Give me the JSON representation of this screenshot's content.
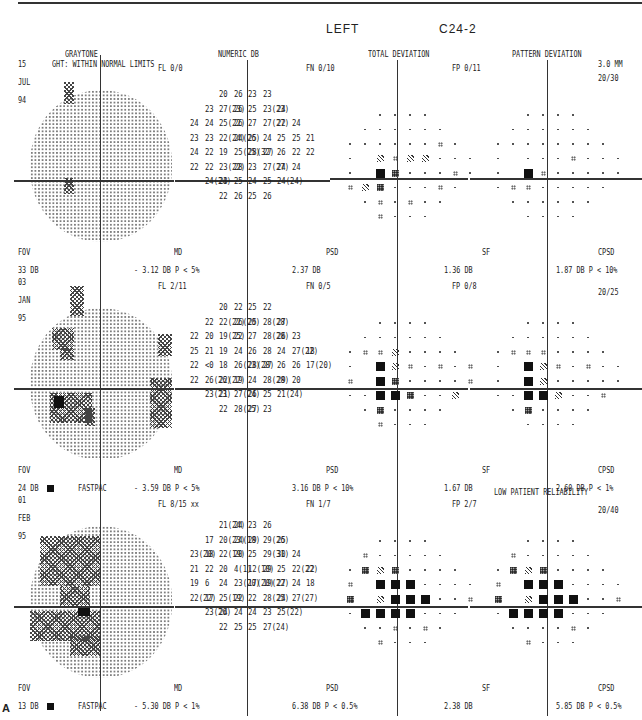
{
  "header": {
    "eye": "LEFT",
    "program": "C24-2"
  },
  "columns": [
    "GRAYTONE",
    "NUMERIC DB",
    "TOTAL DEVIATION",
    "PATTERN DEVIATION"
  ],
  "figure_label": "A",
  "tests": [
    {
      "date": [
        "15",
        "JUL",
        "94"
      ],
      "ght": "GHT: WITHIN NORMAL LIMITS",
      "fl": "FL 0/0",
      "fn": "FN 0/10",
      "fp": "FP 0/11",
      "pupil": "3.0 MM",
      "acuity": "20/30",
      "reliability_note": "",
      "fov_label": "FOV",
      "fov_value": "33 DB",
      "strategy": "",
      "md_label": "MD",
      "md_value": "- 3.12 DB  P <  5%",
      "psd_label": "PSD",
      "psd_value": "2.37 DB",
      "sf_label": "SF",
      "sf_value": "1.36 DB",
      "cpsd_label": "CPSD",
      "cpsd_value": "1.87 DB  P < 10%",
      "numeric_rows": [
        [
          "20",
          "26",
          "|",
          "23",
          "23"
        ],
        [
          "23",
          "27(23)",
          "26",
          "|",
          "25",
          "23(23)",
          "24"
        ],
        [
          "24",
          "24",
          "25(22)",
          "26",
          "|",
          "27",
          "27(27)",
          "22",
          "24"
        ],
        [
          "23",
          "23",
          "22(24)",
          "24(26)",
          "|",
          "25",
          "24",
          "25",
          "25",
          "21"
        ],
        [
          "24",
          "22",
          "19",
          "25(25)",
          "|",
          "28(32)",
          "27",
          "26",
          "22",
          "22"
        ],
        [
          "22",
          "22",
          "23(22)",
          "28",
          "|",
          "23",
          "27(27)",
          "24",
          "24"
        ],
        [
          "24(24)",
          "23",
          "25",
          "|",
          "24",
          "25",
          "24(24)"
        ],
        [
          "22",
          "26",
          "|",
          "25",
          "26"
        ]
      ]
    },
    {
      "date": [
        "03",
        "JAN",
        "95"
      ],
      "ght": "",
      "fl": "FL 2/11",
      "fn": "FN 0/5",
      "fp": "FP 0/8",
      "pupil": "",
      "acuity": "20/25",
      "reliability_note": "",
      "fov_label": "FOV",
      "fov_value": "24 DB",
      "strategy": "FASTPAC",
      "md_label": "MD",
      "md_value": "- 3.59 DB  P <  5%",
      "psd_label": "PSD",
      "psd_value": "3.16 DB  P < 10%",
      "sf_label": "SF",
      "sf_value": "1.67 DB",
      "cpsd_label": "CPSD",
      "cpsd_value": "2.60 DB  P <  1%",
      "numeric_rows": [
        [
          "20",
          "22",
          "|",
          "25",
          "22"
        ],
        [
          "22",
          "22(22)",
          "26(20)",
          "|",
          "25",
          "28(28)",
          "27"
        ],
        [
          "22",
          "20",
          "19(25)",
          "22",
          "|",
          "27",
          "28(28)",
          "26",
          "23"
        ],
        [
          "25",
          "21",
          "19",
          "24",
          "|",
          "26",
          "28",
          "24",
          "27(22)",
          "18"
        ],
        [
          "22",
          "<0",
          "18",
          "26(23)",
          "|",
          "28(28)",
          "27",
          "26",
          "26",
          "17(20)"
        ],
        [
          "22",
          "26(26)",
          "22(22)",
          "19",
          "|",
          "24",
          "28(28)",
          "29",
          "20"
        ],
        [
          "23(23)",
          "21",
          "27(24)",
          "|",
          "26",
          "25",
          "21(24)"
        ],
        [
          "22",
          "28(25)",
          "|",
          "27",
          "23"
        ]
      ]
    },
    {
      "date": [
        "01",
        "FEB",
        "95"
      ],
      "ght": "",
      "fl": "FL 8/15 xx",
      "fn": "FN 1/7",
      "fp": "FP 2/7",
      "pupil": "",
      "acuity": "20/40",
      "reliability_note": "LOW PATIENT RELIABILITY",
      "fov_label": "FOV",
      "fov_value": "13 DB",
      "strategy": "FASTPAC",
      "md_label": "MD",
      "md_value": "- 5.30 DB  P <  1%",
      "psd_label": "PSD",
      "psd_value": "6.38 DB  P < 0.5%",
      "sf_label": "SF",
      "sf_value": "2.38 DB",
      "cpsd_label": "CPSD",
      "cpsd_value": "5.85 DB  P < 0.5%",
      "numeric_rows": [
        [
          "21(24)",
          "24",
          "|",
          "23",
          "26"
        ],
        [
          "17",
          "20(23)",
          "24(18)",
          "|",
          "29",
          "29(26)",
          "25"
        ],
        [
          "23(20)",
          "18",
          "22(19)",
          "20",
          "|",
          "25",
          "29(31)",
          "30",
          "24"
        ],
        [
          "21",
          "22",
          "20",
          "4(1)",
          "|",
          "12(10)",
          "29",
          "25",
          "22(22)",
          "22"
        ],
        [
          "19",
          "6",
          "24",
          "23(20)",
          "|",
          "17(20)",
          "19(22)",
          "27",
          "24",
          "18"
        ],
        [
          "22(22)",
          "17",
          "25(19)",
          "22",
          "|",
          "22",
          "28(25)",
          "24",
          "27(27)"
        ],
        [
          "23(26)",
          "24",
          "24",
          "|",
          "24",
          "23",
          "25(22)"
        ],
        [
          "22",
          "25",
          "|",
          "25",
          "27(24)"
        ]
      ]
    }
  ],
  "chart_data": {
    "type": "table",
    "series": [
      {
        "name": "15 JUL 94",
        "MD_dB": -3.12,
        "MD_p": "<5%",
        "PSD_dB": 2.37,
        "SF_dB": 1.36,
        "CPSD_dB": 1.87,
        "CPSD_p": "<10%",
        "FOV_dB": 33,
        "FL": "0/0",
        "FN": "0/10",
        "FP": "0/11",
        "acuity": "20/30",
        "pupil_mm": 3.0
      },
      {
        "name": "03 JAN 95",
        "MD_dB": -3.59,
        "MD_p": "<5%",
        "PSD_dB": 3.16,
        "PSD_p": "<10%",
        "SF_dB": 1.67,
        "CPSD_dB": 2.6,
        "CPSD_p": "<1%",
        "FOV_dB": 24,
        "FL": "2/11",
        "FN": "0/5",
        "FP": "0/8",
        "acuity": "20/25"
      },
      {
        "name": "01 FEB 95",
        "MD_dB": -5.3,
        "MD_p": "<1%",
        "PSD_dB": 6.38,
        "PSD_p": "<0.5%",
        "SF_dB": 2.38,
        "CPSD_dB": 5.85,
        "CPSD_p": "<0.5%",
        "FOV_dB": 13,
        "FL": "8/15",
        "FN": "1/7",
        "FP": "2/7",
        "acuity": "20/40"
      }
    ]
  }
}
